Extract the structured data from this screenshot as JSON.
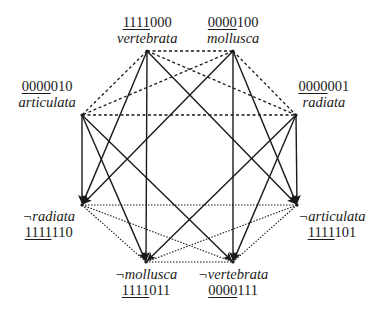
{
  "diagram": {
    "title": "",
    "nodes": [
      {
        "id": "vertebrata",
        "name": "vertebrata",
        "code_underlined": "1111",
        "code_rest": "000",
        "x": 147,
        "y": 51,
        "label_x": 147,
        "label_y": 14,
        "order": "code-first"
      },
      {
        "id": "mollusca",
        "name": "mollusca",
        "code_underlined": "0000",
        "code_rest": "100",
        "x": 233,
        "y": 51,
        "label_x": 233,
        "label_y": 14,
        "order": "code-first"
      },
      {
        "id": "articulata",
        "name": "articulata",
        "code_underlined": "0000",
        "code_rest": "010",
        "x": 82,
        "y": 115,
        "label_x": 47,
        "label_y": 78,
        "order": "code-first"
      },
      {
        "id": "radiata",
        "name": "radiata",
        "code_underlined": "0000",
        "code_rest": "001",
        "x": 296,
        "y": 115,
        "label_x": 324,
        "label_y": 78,
        "order": "code-first"
      },
      {
        "id": "not-radiata",
        "name": "¬radiata",
        "code_underlined": "1111",
        "code_rest": "110",
        "x": 82,
        "y": 205,
        "label_x": 49,
        "label_y": 208,
        "order": "name-first"
      },
      {
        "id": "not-articulata",
        "name": "¬articulata",
        "code_underlined": "1111",
        "code_rest": "101",
        "x": 297,
        "y": 205,
        "label_x": 332,
        "label_y": 208,
        "order": "name-first"
      },
      {
        "id": "not-mollusca",
        "name": "¬mollusca",
        "code_underlined": "1111",
        "code_rest": "011",
        "x": 146,
        "y": 262,
        "label_x": 146,
        "label_y": 266,
        "order": "name-first"
      },
      {
        "id": "not-vertebrata",
        "name": "¬vertebrata",
        "code_underlined": "0000",
        "code_rest": "111",
        "x": 233,
        "y": 262,
        "label_x": 233,
        "label_y": 266,
        "order": "name-first"
      }
    ],
    "edge_styles": {
      "implies": {
        "stroke": "#1a1a1a",
        "width": 1.4,
        "dash": "",
        "arrow": true
      },
      "top_disjoint": {
        "stroke": "#1a1a1a",
        "width": 1.3,
        "dash": "3,2.5",
        "arrow": false
      },
      "bottom_cover": {
        "stroke": "#1a1a1a",
        "width": 1.1,
        "dash": "1.5,1.5",
        "arrow": false
      }
    },
    "edges": [
      {
        "from": "vertebrata",
        "to": "not-radiata",
        "style": "implies"
      },
      {
        "from": "vertebrata",
        "to": "not-articulata",
        "style": "implies"
      },
      {
        "from": "vertebrata",
        "to": "not-mollusca",
        "style": "implies"
      },
      {
        "from": "mollusca",
        "to": "not-radiata",
        "style": "implies"
      },
      {
        "from": "mollusca",
        "to": "not-articulata",
        "style": "implies"
      },
      {
        "from": "mollusca",
        "to": "not-vertebrata",
        "style": "implies"
      },
      {
        "from": "articulata",
        "to": "not-radiata",
        "style": "implies"
      },
      {
        "from": "articulata",
        "to": "not-mollusca",
        "style": "implies"
      },
      {
        "from": "articulata",
        "to": "not-vertebrata",
        "style": "implies"
      },
      {
        "from": "radiata",
        "to": "not-articulata",
        "style": "implies"
      },
      {
        "from": "radiata",
        "to": "not-mollusca",
        "style": "implies"
      },
      {
        "from": "radiata",
        "to": "not-vertebrata",
        "style": "implies"
      },
      {
        "from": "vertebrata",
        "to": "mollusca",
        "style": "top_disjoint"
      },
      {
        "from": "vertebrata",
        "to": "articulata",
        "style": "top_disjoint"
      },
      {
        "from": "vertebrata",
        "to": "radiata",
        "style": "top_disjoint"
      },
      {
        "from": "mollusca",
        "to": "articulata",
        "style": "top_disjoint"
      },
      {
        "from": "mollusca",
        "to": "radiata",
        "style": "top_disjoint"
      },
      {
        "from": "articulata",
        "to": "radiata",
        "style": "top_disjoint"
      },
      {
        "from": "not-radiata",
        "to": "not-articulata",
        "style": "bottom_cover"
      },
      {
        "from": "not-radiata",
        "to": "not-mollusca",
        "style": "bottom_cover"
      },
      {
        "from": "not-radiata",
        "to": "not-vertebrata",
        "style": "bottom_cover"
      },
      {
        "from": "not-articulata",
        "to": "not-mollusca",
        "style": "bottom_cover"
      },
      {
        "from": "not-articulata",
        "to": "not-vertebrata",
        "style": "bottom_cover"
      },
      {
        "from": "not-mollusca",
        "to": "not-vertebrata",
        "style": "bottom_cover"
      }
    ]
  }
}
